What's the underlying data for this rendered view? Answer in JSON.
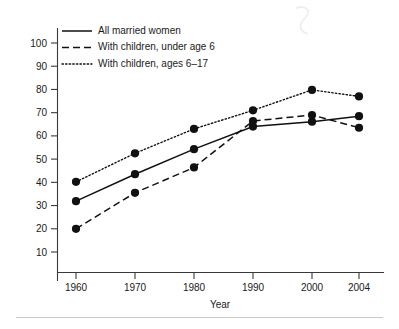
{
  "chart_data": {
    "type": "line",
    "title": "",
    "subtitle": "",
    "xlabel": "Year",
    "ylabel": "",
    "categories": [
      "1960",
      "1970",
      "1980",
      "1990",
      "2000",
      "2004"
    ],
    "x": [
      1960,
      1970,
      1980,
      1990,
      2000,
      2004
    ],
    "xlim": [
      1955,
      2009
    ],
    "ylim": [
      0,
      105
    ],
    "yticks": [
      10,
      20,
      30,
      40,
      50,
      60,
      70,
      80,
      90,
      100
    ],
    "ytick_labels": [
      "10",
      "20",
      "30",
      "40",
      "50",
      "60",
      "70",
      "80",
      "90",
      "100"
    ],
    "xtick_labels": [
      "1960",
      "1970",
      "1980",
      "1990",
      "2000",
      "2004"
    ],
    "grid": false,
    "legend_position": "top-left",
    "series": [
      {
        "name": "All married women",
        "style": "solid",
        "color": "#111111",
        "values": [
          31.9,
          43.5,
          54.3,
          64.0,
          66.1,
          68.5
        ]
      },
      {
        "name": "With children, under age 6",
        "style": "dashed",
        "color": "#111111",
        "values": [
          20.0,
          35.5,
          46.4,
          66.4,
          69.0,
          63.5
        ]
      },
      {
        "name": "With children, ages 6–17",
        "style": "dotted",
        "color": "#111111",
        "values": [
          40.2,
          52.5,
          63.0,
          71.0,
          79.8,
          77.0
        ]
      }
    ],
    "annotations": []
  },
  "legend": {
    "items": [
      {
        "label": "All married women",
        "style": "solid"
      },
      {
        "label": "With children, under age 6",
        "style": "dashed"
      },
      {
        "label": "With children, ages 6–17",
        "style": "dotted"
      }
    ]
  },
  "axes": {
    "x_title": "Year"
  }
}
